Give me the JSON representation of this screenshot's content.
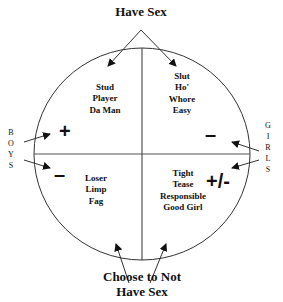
{
  "diagram": {
    "top_label": "Have Sex",
    "bottom_label_line1": "Choose to Not",
    "bottom_label_line2": "Have Sex",
    "left_side_label": [
      "B",
      "O",
      "Y",
      "S"
    ],
    "right_side_label": [
      "G",
      "I",
      "R",
      "L",
      "S"
    ],
    "quadrants": {
      "top_left": {
        "lines": [
          "Stud",
          "Player",
          "Da Man"
        ],
        "sign": "+"
      },
      "top_right": {
        "lines": [
          "Slut",
          "Ho'",
          "Whore",
          "Easy"
        ],
        "sign": "–"
      },
      "bottom_left": {
        "lines": [
          "Loser",
          "Limp",
          "Fag"
        ],
        "sign": "–"
      },
      "bottom_right": {
        "lines": [
          "Tight",
          "Tease",
          "Responsible",
          "Good Girl"
        ],
        "sign": "+/-"
      }
    },
    "colors": {
      "line": "#333333",
      "text": "#111111",
      "background": "#ffffff"
    }
  }
}
